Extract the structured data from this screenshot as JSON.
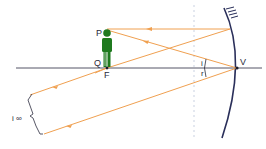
{
  "diagram": {
    "labels": {
      "P": "P",
      "Q": "Q",
      "F": "F",
      "V": "V",
      "i": "i",
      "r": "r",
      "image": "i ∞"
    },
    "colors": {
      "ray": "#f0a050",
      "axis": "#555566",
      "mirror": "#2a2f5a",
      "object": "#1f7a1f",
      "background": "#ffffff"
    }
  }
}
